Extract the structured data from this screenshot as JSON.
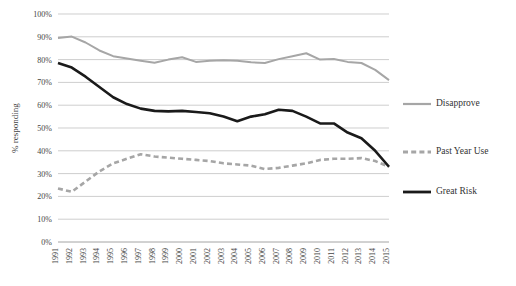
{
  "chart_data": {
    "type": "line",
    "title": "",
    "xlabel": "",
    "ylabel": "% responding",
    "ylim": [
      0,
      100
    ],
    "ytick_labels": [
      "0%",
      "10%",
      "20%",
      "30%",
      "40%",
      "50%",
      "60%",
      "70%",
      "80%",
      "90%",
      "100%"
    ],
    "ytick_values": [
      0,
      10,
      20,
      30,
      40,
      50,
      60,
      70,
      80,
      90,
      100
    ],
    "grid": true,
    "legend_position": "right",
    "categories": [
      "1991",
      "1992",
      "1993",
      "1994",
      "1995",
      "1996",
      "1997",
      "1998",
      "1999",
      "2000",
      "2001",
      "2002",
      "2003",
      "2004",
      "2005",
      "2006",
      "2007",
      "2008",
      "2009",
      "2010",
      "2011",
      "2012",
      "2013",
      "2014",
      "2015"
    ],
    "series": [
      {
        "name": "Disapprove",
        "color": "#a6a6a6",
        "style": "solid",
        "values": [
          89.5,
          90.1,
          87.5,
          84.0,
          81.5,
          80.5,
          79.5,
          78.6,
          80.0,
          81.0,
          79.0,
          79.5,
          79.7,
          79.5,
          78.8,
          78.5,
          80.2,
          81.5,
          82.8,
          80.0,
          80.3,
          79.0,
          78.5,
          75.5,
          71.0
        ]
      },
      {
        "name": "Past Year Use",
        "color": "#a6a6a6",
        "style": "dashed",
        "values": [
          23.5,
          22.0,
          26.5,
          31.0,
          34.5,
          36.5,
          38.5,
          37.5,
          37.0,
          36.5,
          36.0,
          35.5,
          34.5,
          34.0,
          33.5,
          32.0,
          32.5,
          33.5,
          34.5,
          36.0,
          36.5,
          36.5,
          36.8,
          35.5,
          33.0
        ]
      },
      {
        "name": "Great Risk",
        "color": "#1a1a1a",
        "style": "solid",
        "values": [
          78.5,
          76.5,
          72.5,
          68.0,
          63.5,
          60.5,
          58.5,
          57.5,
          57.3,
          57.5,
          57.0,
          56.5,
          55.0,
          53.0,
          55.0,
          56.0,
          58.0,
          57.5,
          55.0,
          52.0,
          52.0,
          48.0,
          45.5,
          40.0,
          33.0
        ]
      }
    ]
  },
  "legend": {
    "items": [
      {
        "label": "Disapprove"
      },
      {
        "label": "Past Year Use"
      },
      {
        "label": "Great Risk"
      }
    ]
  }
}
